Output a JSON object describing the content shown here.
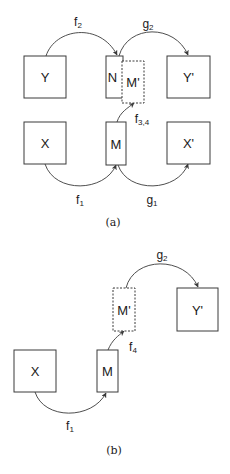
{
  "colors": {
    "stroke": "#3a3a3a",
    "text": "#1a1a1a",
    "background": "#ffffff"
  },
  "panels": [
    {
      "id": "a",
      "caption": "(a)",
      "caption_pos": [
        113,
        222
      ],
      "nodes": [
        {
          "id": "Y",
          "label": "Y",
          "x": 24,
          "y": 56,
          "w": 42,
          "h": 42,
          "dashed": false
        },
        {
          "id": "N",
          "label": "N",
          "x": 106,
          "y": 56,
          "w": 17,
          "h": 42,
          "dashed": false,
          "label_dx": -2
        },
        {
          "id": "Mp",
          "label": "M'",
          "x": 122,
          "y": 61,
          "w": 22,
          "h": 42,
          "dashed": true
        },
        {
          "id": "Yp",
          "label": "Y'",
          "x": 167,
          "y": 56,
          "w": 43,
          "h": 42,
          "dashed": false
        },
        {
          "id": "X",
          "label": "X",
          "x": 24,
          "y": 122,
          "w": 42,
          "h": 42,
          "dashed": false
        },
        {
          "id": "M",
          "label": "M",
          "x": 106,
          "y": 122,
          "w": 20,
          "h": 43,
          "dashed": false
        },
        {
          "id": "Xp",
          "label": "X'",
          "x": 167,
          "y": 122,
          "w": 43,
          "h": 42,
          "dashed": false
        }
      ],
      "edges": [
        {
          "id": "f2",
          "base": "f",
          "sub": "2",
          "path": "M 46 56 C 55 28, 100 22, 117 55",
          "label_pos": [
            78,
            23
          ]
        },
        {
          "id": "g2",
          "base": "g",
          "sub": "2",
          "path": "M 119 56 C 128 24, 175 24, 188 55",
          "label_pos": [
            148,
            25
          ]
        },
        {
          "id": "f34",
          "base": "f",
          "sub": "3,4",
          "path": "M 117 122 C 120 112, 128 108, 134 103",
          "label_pos": [
            142,
            120
          ]
        },
        {
          "id": "f1",
          "base": "f",
          "sub": "1",
          "path": "M 45 164 C 55 194, 105 192, 116 165",
          "label_pos": [
            80,
            201
          ]
        },
        {
          "id": "g1",
          "base": "g",
          "sub": "1",
          "path": "M 118 165 C 128 194, 178 192, 188 164",
          "label_pos": [
            152,
            201
          ]
        }
      ]
    },
    {
      "id": "b",
      "caption": "(b)",
      "caption_pos": [
        114,
        450
      ],
      "nodes": [
        {
          "id": "Mp",
          "label": "M'",
          "x": 113,
          "y": 288,
          "w": 22,
          "h": 43,
          "dashed": true
        },
        {
          "id": "Yp",
          "label": "Y'",
          "x": 177,
          "y": 288,
          "w": 41,
          "h": 43,
          "dashed": false
        },
        {
          "id": "X",
          "label": "X",
          "x": 14,
          "y": 350,
          "w": 42,
          "h": 42,
          "dashed": false
        },
        {
          "id": "M",
          "label": "M",
          "x": 97,
          "y": 350,
          "w": 21,
          "h": 42,
          "dashed": false
        }
      ],
      "edges": [
        {
          "id": "g2",
          "base": "g",
          "sub": "2",
          "path": "M 126 288 C 134 256, 185 256, 198 287",
          "label_pos": [
            162,
            256
          ]
        },
        {
          "id": "f4",
          "base": "f",
          "sub": "4",
          "path": "M 108 350 C 112 340, 118 336, 124 331",
          "label_pos": [
            133,
            348
          ]
        },
        {
          "id": "f1",
          "base": "f",
          "sub": "1",
          "path": "M 35 392 C 44 420, 92 420, 106 393",
          "label_pos": [
            70,
            427
          ]
        }
      ]
    }
  ]
}
